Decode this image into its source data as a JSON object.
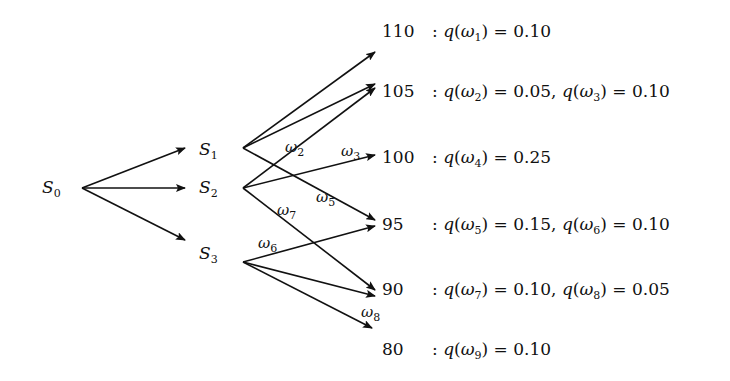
{
  "nodes": {
    "root": {
      "name": "S",
      "sub": "0"
    },
    "mid": [
      {
        "name": "S",
        "sub": "1"
      },
      {
        "name": "S",
        "sub": "2"
      },
      {
        "name": "S",
        "sub": "3"
      }
    ]
  },
  "outcomes": [
    {
      "value": "110",
      "probs": [
        {
          "w": "1",
          "p": "0.10"
        }
      ]
    },
    {
      "value": "105",
      "probs": [
        {
          "w": "2",
          "p": "0.05"
        },
        {
          "w": "3",
          "p": "0.10"
        }
      ]
    },
    {
      "value": "100",
      "probs": [
        {
          "w": "4",
          "p": "0.25"
        }
      ]
    },
    {
      "value": "95",
      "probs": [
        {
          "w": "5",
          "p": "0.15"
        },
        {
          "w": "6",
          "p": "0.10"
        }
      ]
    },
    {
      "value": "90",
      "probs": [
        {
          "w": "7",
          "p": "0.10"
        },
        {
          "w": "8",
          "p": "0.05"
        }
      ]
    },
    {
      "value": "80",
      "probs": [
        {
          "w": "9",
          "p": "0.10"
        }
      ]
    }
  ],
  "edge_labels": [
    {
      "name": "ω",
      "sub": "2"
    },
    {
      "name": "ω",
      "sub": "3"
    },
    {
      "name": "ω",
      "sub": "5"
    },
    {
      "name": "ω",
      "sub": "7"
    },
    {
      "name": "ω",
      "sub": "6"
    },
    {
      "name": "ω",
      "sub": "8"
    }
  ],
  "edges": [
    {
      "from": "S0",
      "to": "S1"
    },
    {
      "from": "S0",
      "to": "S2"
    },
    {
      "from": "S0",
      "to": "S3"
    },
    {
      "from": "S1",
      "to": "110"
    },
    {
      "from": "S1",
      "to": "105"
    },
    {
      "from": "S1",
      "to": "95"
    },
    {
      "from": "S2",
      "to": "105"
    },
    {
      "from": "S2",
      "to": "100"
    },
    {
      "from": "S2",
      "to": "90"
    },
    {
      "from": "S3",
      "to": "95"
    },
    {
      "from": "S3",
      "to": "90"
    },
    {
      "from": "S3",
      "to": "80"
    }
  ],
  "text": {
    "colon": ":",
    "q": "q",
    "eq": "=",
    "comma": ","
  }
}
